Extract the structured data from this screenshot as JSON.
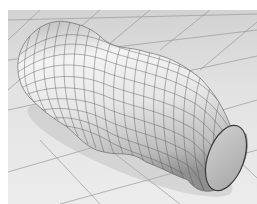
{
  "image": {
    "description": "3D render of a deformed wavy cylinder with a wireframe grid lying on a tiled floor",
    "caption": ""
  },
  "colors": {
    "background": "#ffffff",
    "floor": "#e6e6e6",
    "floor_far": "#d8d8d8",
    "floor_lines": "#9a9a9a",
    "surface_light": "#f2f2f2",
    "surface_mid": "#d4d4d4",
    "surface_dark": "#9c9c9c",
    "mesh_lines": "#5a5a5a",
    "cap_fill": "#bdbdbd",
    "cap_edge": "#3a3a3a"
  },
  "scene": {
    "objects": [
      {
        "name": "tiled-floor",
        "type": "plane"
      },
      {
        "name": "deformed-cylinder",
        "type": "mesh",
        "wireframe": true
      },
      {
        "name": "cylinder-end-cap",
        "type": "ellipse"
      }
    ]
  }
}
